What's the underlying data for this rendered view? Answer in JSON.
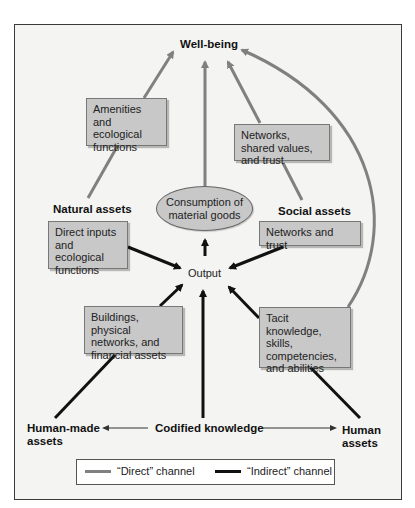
{
  "title": "Well-being",
  "nodes": {
    "wellbeing": "Well-being",
    "amenities": "Amenities and ecological functions",
    "networks_shared": "Networks, shared values, and trust",
    "consumption": "Consumption of material goods",
    "natural_assets": "Natural assets",
    "social_assets": "Social assets",
    "direct_inputs": "Direct inputs and ecological functions",
    "networks_trust": "Networks and trust",
    "output": "Output",
    "buildings": "Buildings, physical networks, and financial assets",
    "tacit": "Tacit knowledge, skills, competencies, and abilities",
    "human_made": "Human-made assets",
    "codified": "Codified knowledge",
    "human_assets": "Human assets"
  },
  "legend": {
    "direct": "“Direct” channel",
    "indirect": "“Indirect” channel"
  },
  "colors": {
    "direct": "#808080",
    "indirect": "#111111",
    "box_fill": "#c8c8c8",
    "background": "#f4f4f2"
  }
}
